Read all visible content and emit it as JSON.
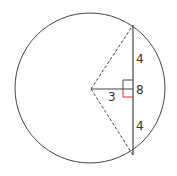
{
  "diagram": {
    "type": "circle-chord-geometry",
    "labels": {
      "upper_half": "4",
      "lower_half": "4",
      "chord_length": "8",
      "distance_to_center": "3"
    },
    "colors": {
      "line": "#444444",
      "right_angle_accent": "#cc3333",
      "background": "#ffffff"
    }
  }
}
